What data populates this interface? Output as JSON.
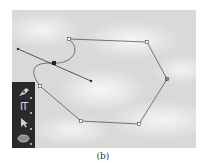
{
  "caption": "(b)",
  "canvas": {
    "background": "clouds-photo",
    "path": {
      "stroke_color": "#555555",
      "anchors": [
        {
          "x": 69,
          "y": 39
        },
        {
          "x": 147,
          "y": 42
        },
        {
          "x": 167,
          "y": 79
        },
        {
          "x": 139,
          "y": 124
        },
        {
          "x": 81,
          "y": 121
        },
        {
          "x": 40,
          "y": 86
        }
      ],
      "selected_anchor": {
        "x": 54,
        "y": 63
      },
      "handles": [
        {
          "x": 18,
          "y": 49
        },
        {
          "x": 91,
          "y": 81
        }
      ]
    }
  },
  "toolbar": {
    "tools": [
      {
        "name": "pen-tool",
        "icon": "pen-icon"
      },
      {
        "name": "type-tool",
        "icon": "type-icon",
        "label": "IT"
      },
      {
        "name": "selection-tool",
        "icon": "arrow-icon"
      },
      {
        "name": "ellipse-tool",
        "icon": "ellipse-icon"
      }
    ]
  }
}
